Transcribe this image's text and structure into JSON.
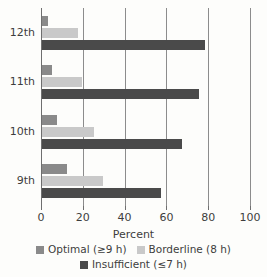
{
  "chart_data": {
    "type": "bar",
    "orientation": "horizontal",
    "title": "",
    "xlabel": "Percent",
    "ylabel": "",
    "categories": [
      "12th",
      "11th",
      "10th",
      "9th"
    ],
    "series": [
      {
        "name": "Optimal (≥9 h)",
        "color": "#8a8a8a",
        "values": [
          3,
          5,
          7,
          12
        ]
      },
      {
        "name": "Borderline (8 h)",
        "color": "#c9c9c9",
        "values": [
          17,
          19,
          25,
          29
        ]
      },
      {
        "name": "Insufficient (≤7 h)",
        "color": "#4a4a4a",
        "values": [
          78,
          75,
          67,
          57
        ]
      }
    ],
    "xlim": [
      0,
      100
    ],
    "xticks": [
      0,
      20,
      40,
      60,
      80,
      100
    ],
    "xtick_labels": [
      "0",
      "20",
      "40",
      "60",
      "80",
      "100"
    ],
    "grid": true,
    "legend_position": "bottom"
  },
  "axis": {
    "x_title": "Percent"
  },
  "legend": {
    "row1": [
      {
        "label": "Optimal (≥9 h)",
        "color": "#8a8a8a"
      },
      {
        "label": "Borderline (8 h)",
        "color": "#c9c9c9"
      }
    ],
    "row2": [
      {
        "label": "Insufficient (≤7 h)",
        "color": "#4a4a4a"
      }
    ]
  }
}
